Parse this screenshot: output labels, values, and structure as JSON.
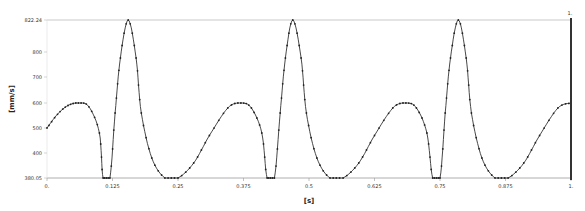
{
  "chart_data": {
    "type": "line",
    "title": "",
    "xlabel": "[s]",
    "ylabel": "[mm/s]",
    "xlim": [
      0,
      1
    ],
    "ylim_labels": [
      "380.05",
      "822.24"
    ],
    "x_ticks": [
      "0.",
      "0.125",
      "0.25",
      "0.375",
      "0.5",
      "0.625",
      "0.75",
      "0.875",
      "1."
    ],
    "y_ticks": [
      "380.05",
      "400",
      "500",
      "600",
      "700",
      "800",
      "822.24"
    ],
    "cursor_label": "1.",
    "grid": false,
    "legend": null,
    "markers": true,
    "series": [
      {
        "name": "velocity",
        "color": "#333333",
        "x": [
          0,
          0.02,
          0.04,
          0.06,
          0.08,
          0.1,
          0.107,
          0.12,
          0.13,
          0.14,
          0.155,
          0.17,
          0.18,
          0.2,
          0.225,
          0.25,
          0.28,
          0.31,
          0.345,
          0.37,
          0.39,
          0.41,
          0.42,
          0.434,
          0.445,
          0.455,
          0.469,
          0.485,
          0.495,
          0.515,
          0.54,
          0.565,
          0.595,
          0.625,
          0.66,
          0.685,
          0.705,
          0.725,
          0.736,
          0.75,
          0.76,
          0.77,
          0.785,
          0.8,
          0.81,
          0.83,
          0.855,
          0.88,
          0.91,
          0.94,
          0.975,
          1.0
        ],
        "y": [
          500,
          555,
          590,
          600,
          585,
          480,
          300,
          300,
          560,
          780,
          932,
          780,
          560,
          380,
          300,
          300,
          360,
          470,
          580,
          600,
          580,
          480,
          300,
          300,
          560,
          780,
          932,
          780,
          560,
          380,
          300,
          300,
          360,
          470,
          580,
          600,
          580,
          480,
          300,
          300,
          560,
          780,
          932,
          780,
          560,
          380,
          300,
          300,
          360,
          470,
          580,
          600
        ]
      }
    ]
  }
}
